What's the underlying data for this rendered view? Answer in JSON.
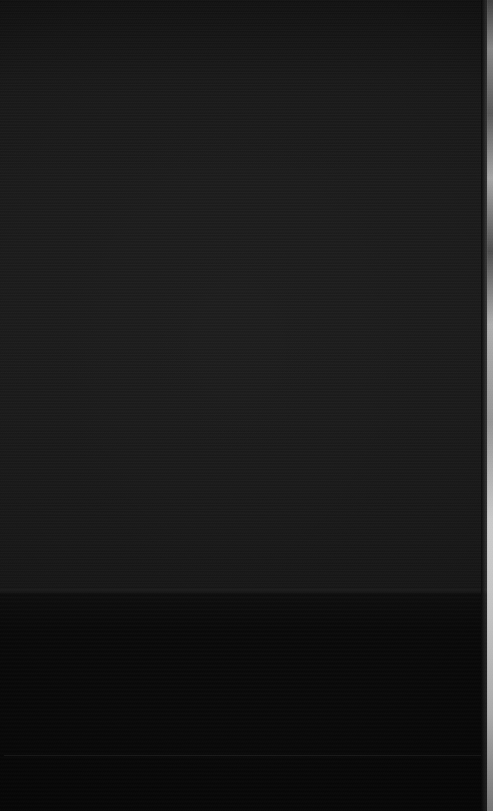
{
  "capture": {
    "description": "Near-black screen capture with no legible on-screen text or icons",
    "width": 493,
    "height": 811,
    "notes": "Underexposed / blank screen state"
  },
  "regions": {
    "upper": {
      "name": "upper-dark-panel",
      "color": "#1e1e1e",
      "top": 0,
      "height": 593,
      "content": ""
    },
    "lower": {
      "name": "lower-black-panel",
      "color": "#0a0a0a",
      "top": 593,
      "height": 218,
      "content": ""
    },
    "divider": {
      "name": "panel-seam",
      "color": "#2a2a2a",
      "top": 589
    },
    "faint_rule": {
      "name": "faint-horizontal-rule",
      "color": "#ffffff",
      "top": 755
    }
  },
  "edge_strip": {
    "name": "right-edge-light-strip",
    "color": "#f2f2f2",
    "left": 487,
    "width": 6,
    "height": 811,
    "role": "scrollbar-or-background-sliver"
  },
  "palette": {
    "upper_panel": "#1e1e1e",
    "lower_panel": "#0a0a0a",
    "seam": "#2a2a2a",
    "edge_light": "#f2f2f2",
    "page_background": "#000000"
  }
}
